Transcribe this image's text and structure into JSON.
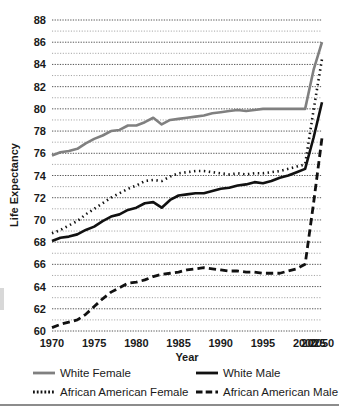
{
  "chart_data": {
    "type": "line",
    "title": "",
    "xlabel": "Year",
    "ylabel": "Life Expectancy",
    "categories": [
      1970,
      1971,
      1972,
      1973,
      1974,
      1975,
      1976,
      1977,
      1978,
      1979,
      1980,
      1981,
      1982,
      1983,
      1984,
      1985,
      1986,
      1987,
      1988,
      1989,
      1990,
      1991,
      1992,
      1993,
      1994,
      1995,
      1996,
      1997,
      1998,
      1999,
      2000,
      2025,
      2050
    ],
    "xtick_labels": [
      "1970",
      "1975",
      "1980",
      "1985",
      "1990",
      "1995",
      "2000",
      "2025",
      "2050"
    ],
    "xtick_values": [
      1970,
      1975,
      1980,
      1985,
      1990,
      1995,
      2000,
      2025,
      2050
    ],
    "ytick_labels": [
      "60",
      "62",
      "64",
      "66",
      "68",
      "70",
      "72",
      "74",
      "76",
      "78",
      "80",
      "82",
      "84",
      "86",
      "88"
    ],
    "ytick_values": [
      60,
      62,
      64,
      66,
      68,
      70,
      72,
      74,
      76,
      78,
      80,
      82,
      84,
      86,
      88
    ],
    "ylim": [
      60,
      88
    ],
    "grid": "horizontal-dotted-every-1-unit",
    "legend_position": "below-plot",
    "series": [
      {
        "name": "White Female",
        "style": "solid",
        "color": "#808080",
        "width": 2.6,
        "values": [
          75.8,
          76.1,
          76.2,
          76.4,
          76.9,
          77.3,
          77.6,
          78.0,
          78.1,
          78.5,
          78.5,
          78.8,
          79.2,
          78.6,
          79.0,
          79.1,
          79.2,
          79.3,
          79.4,
          79.6,
          79.7,
          79.8,
          79.9,
          79.8,
          79.9,
          80.0,
          80.0,
          80.0,
          80.0,
          80.0,
          80.0,
          83.5,
          86.0
        ]
      },
      {
        "name": "White Male",
        "style": "solid",
        "color": "#111111",
        "width": 2.6,
        "values": [
          68.1,
          68.4,
          68.5,
          68.7,
          69.1,
          69.4,
          69.9,
          70.3,
          70.5,
          70.9,
          71.1,
          71.5,
          71.6,
          71.1,
          71.8,
          72.2,
          72.3,
          72.4,
          72.4,
          72.6,
          72.8,
          72.9,
          73.1,
          73.2,
          73.4,
          73.3,
          73.5,
          73.8,
          74.0,
          74.3,
          74.6,
          77.4,
          80.6
        ]
      },
      {
        "name": "African American Female",
        "style": "dotted",
        "color": "#111111",
        "width": 2.6,
        "values": [
          68.8,
          69.1,
          69.5,
          69.9,
          70.5,
          71.0,
          71.5,
          72.0,
          72.4,
          72.8,
          73.1,
          73.5,
          73.6,
          73.5,
          73.9,
          74.2,
          74.3,
          74.4,
          74.4,
          74.3,
          74.2,
          74.1,
          74.2,
          74.1,
          74.2,
          74.2,
          74.3,
          74.4,
          74.6,
          74.8,
          75.0,
          79.9,
          84.5
        ]
      },
      {
        "name": "African American Male",
        "style": "dashed",
        "color": "#111111",
        "width": 2.8,
        "values": [
          60.3,
          60.6,
          60.8,
          61.0,
          61.5,
          62.2,
          62.9,
          63.5,
          63.9,
          64.3,
          64.4,
          64.6,
          64.9,
          65.1,
          65.2,
          65.3,
          65.5,
          65.6,
          65.7,
          65.6,
          65.5,
          65.4,
          65.4,
          65.3,
          65.3,
          65.2,
          65.2,
          65.2,
          65.4,
          65.6,
          66.0,
          71.5,
          77.4
        ]
      }
    ]
  },
  "legend": {
    "items": [
      {
        "label": "White Female",
        "swatch": "solid-gray"
      },
      {
        "label": "White Male",
        "swatch": "solid-black"
      },
      {
        "label": "African American Female",
        "swatch": "dotted-black"
      },
      {
        "label": "African American Male",
        "swatch": "dashed-black"
      }
    ]
  },
  "axes": {
    "x_title": "Year",
    "y_title": "Life Expectancy"
  }
}
